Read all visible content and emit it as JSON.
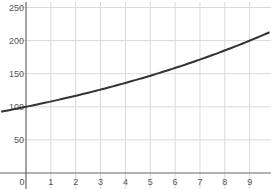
{
  "chart_data": {
    "type": "line",
    "title": "",
    "xlabel": "",
    "ylabel": "",
    "xlim": [
      -1,
      9.9
    ],
    "ylim": [
      0,
      265
    ],
    "grid": true,
    "x_ticks": [
      0,
      1,
      2,
      3,
      4,
      5,
      6,
      7,
      8,
      9
    ],
    "y_ticks": [
      50,
      100,
      150,
      200,
      250
    ],
    "y_tick_labels": [
      "50",
      "100",
      "150",
      "200",
      "250"
    ],
    "series": [
      {
        "name": "y = 100·1.08^x",
        "x": [
          -1,
          0,
          1,
          2,
          3,
          4,
          5,
          6,
          7,
          8,
          9,
          9.8
        ],
        "values": [
          92.6,
          100,
          108,
          116.6,
          126,
          136,
          146.9,
          158.7,
          171.4,
          185.1,
          199.9,
          212.6
        ]
      }
    ],
    "colors": {
      "curve": "#333333",
      "grid": "#d9d9d9",
      "axis": "#666666"
    }
  }
}
